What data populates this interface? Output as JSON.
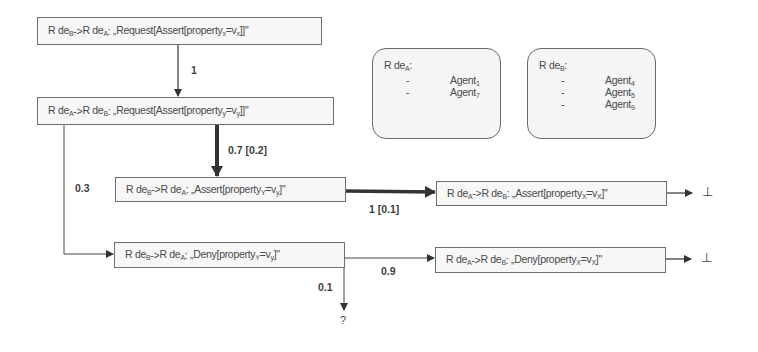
{
  "diagram": {
    "type": "flow",
    "boxes": [
      {
        "id": "b1",
        "from": "R de",
        "from_sub": "B",
        "to": "R de",
        "to_sub": "A",
        "message_pre": "„Request[Assert[property",
        "prop_sub": "x",
        "message_mid": "=v",
        "val_sub": "x",
        "message_post": "]]\""
      },
      {
        "id": "b2",
        "from": "R de",
        "from_sub": "A",
        "to": "R de",
        "to_sub": "B",
        "message_pre": "„Request[Assert[property",
        "prop_sub": "y",
        "message_mid": "=v",
        "val_sub": "y",
        "message_post": "]]\""
      },
      {
        "id": "b3",
        "from": "R de",
        "from_sub": "B",
        "to": "R de",
        "to_sub": "A",
        "message_pre": "„Assert[property",
        "prop_sub": "Y",
        "message_mid": "=v",
        "val_sub": "y",
        "message_post": "]\""
      },
      {
        "id": "b4",
        "from": "R de",
        "from_sub": "A",
        "to": "R de",
        "to_sub": "B",
        "message_pre": "„Assert[property",
        "prop_sub": "X",
        "message_mid": "=v",
        "val_sub": "X",
        "message_post": "]\""
      },
      {
        "id": "b5",
        "from": "R de",
        "from_sub": "B",
        "to": "R de",
        "to_sub": "A",
        "message_pre": "„Deny[property",
        "prop_sub": "Y",
        "message_mid": "=v",
        "val_sub": "y",
        "message_post": "]\""
      },
      {
        "id": "b6",
        "from": "R de",
        "from_sub": "A",
        "to": "R de",
        "to_sub": "B",
        "message_pre": "„Deny[property",
        "prop_sub": "X",
        "message_mid": "=v",
        "val_sub": "X",
        "message_post": "]\""
      }
    ],
    "arrow": "->",
    "colon": ": ",
    "groups": [
      {
        "title": "R de",
        "title_sub": "A",
        "title_suffix": ":",
        "bullet": "-",
        "members": [
          {
            "name": "Agent",
            "sub": "1"
          },
          {
            "name": "Agent",
            "sub": "7"
          }
        ]
      },
      {
        "title": "R de",
        "title_sub": "B",
        "title_suffix": ":",
        "bullet": "-",
        "members": [
          {
            "name": "Agent",
            "sub": "4"
          },
          {
            "name": "Agent",
            "sub": "5"
          },
          {
            "name": "Agent",
            "sub": "9"
          }
        ]
      }
    ],
    "edge_labels": {
      "b1_b2": "1",
      "b2_b3": "0.7 [0.2]",
      "b2_b5": "0.3",
      "b3_b4": "1 [0.1]",
      "b5_b6": "0.9",
      "b5_unknown": "0.1"
    },
    "terminals": {
      "end_symbol": "⊥",
      "unknown_symbol": "?"
    }
  }
}
